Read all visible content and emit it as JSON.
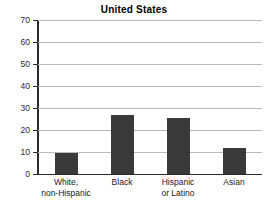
{
  "chart_data": {
    "type": "bar",
    "title": "United States",
    "xlabel": "",
    "ylabel": "",
    "categories": [
      "White, non-Hispanic",
      "Black",
      "Hispanic or Latino",
      "Asian"
    ],
    "category_lines": [
      [
        "White,",
        "non-Hispanic"
      ],
      [
        "Black"
      ],
      [
        "Hispanic",
        "or Latino"
      ],
      [
        "Asian"
      ]
    ],
    "values": [
      9.7,
      27,
      25.5,
      12
    ],
    "ylim": [
      0,
      70
    ],
    "ytick_step": 10,
    "ytick_labels": [
      "0",
      "10",
      "20",
      "30",
      "40",
      "50",
      "60",
      "70"
    ],
    "grid": true,
    "legend": "none",
    "bar_color": "#3a3a3a",
    "gridline_color": "#b9b9b9",
    "axis_color": "#2b2b2b",
    "background_color": "#ffffff"
  }
}
